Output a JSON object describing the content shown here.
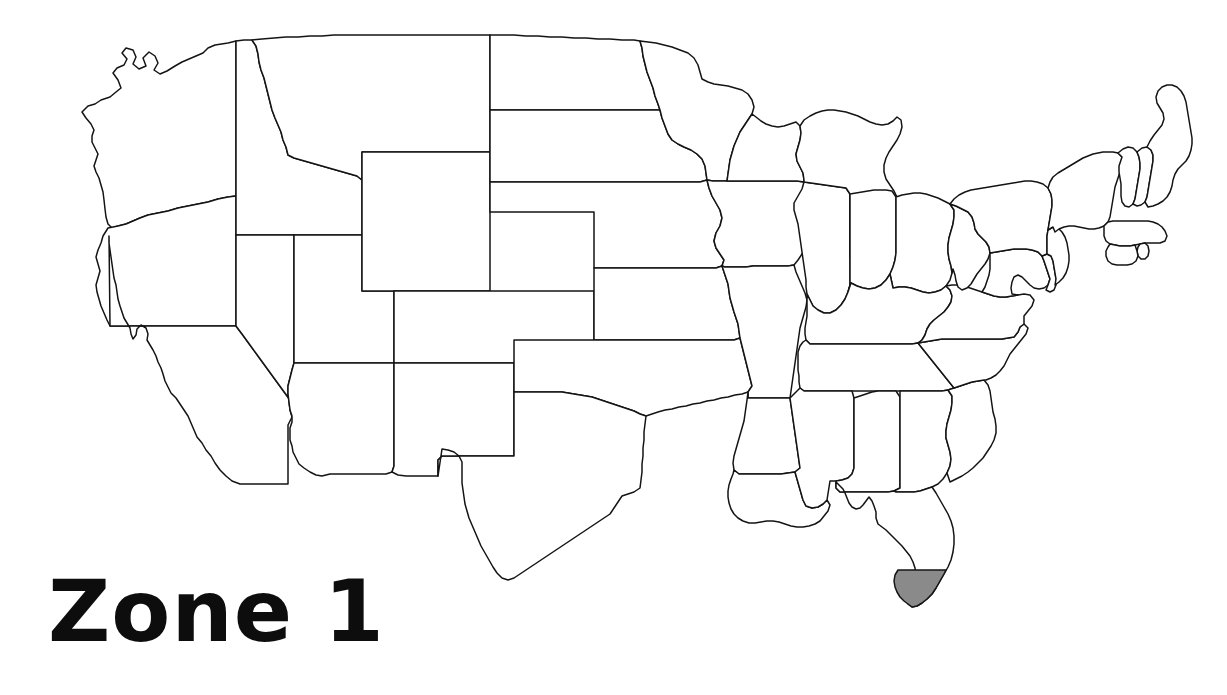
{
  "page": {
    "title": "Zone 1",
    "background_color": "#ffffff",
    "width": 1227,
    "height": 695
  },
  "label": {
    "text": "Zone 1",
    "color": "#0d0d0d",
    "position": "bottom-left"
  },
  "map": {
    "name": "contiguous-united-states-outline-map",
    "region": "Contiguous United States",
    "style": "black-and-white outline",
    "outline_color": "#141414",
    "fill_color": "#ffffff",
    "highlight_color": "#8a8a8a",
    "highlight_description": "Southern tip of Florida shaded gray",
    "highlighted_regions": [
      "South Florida"
    ],
    "state_count": 48
  },
  "legend": {
    "zone_number": "1",
    "zone_name": "Zone 1"
  }
}
